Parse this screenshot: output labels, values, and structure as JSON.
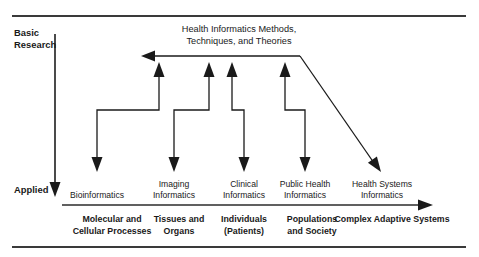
{
  "figure": {
    "title_line1": "Health Informatics Methods,",
    "title_line2": "Techniques, and Theories",
    "y_axis_top_label_line1": "Basic",
    "y_axis_top_label_line2": "Research",
    "y_axis_bottom_label": "Applied",
    "accent_color": "#1a1a1a",
    "rule_color": "#3a3a3a",
    "background_color": "#ffffff"
  },
  "columns": [
    {
      "id": "bioinformatics",
      "label_line1": "Bioinformatics",
      "label_line2": "",
      "domain_line1": "Molecular and",
      "domain_line2": "Cellular Processes",
      "x": 97,
      "domain_x": 112
    },
    {
      "id": "imaging-informatics",
      "label_line1": "Imaging",
      "label_line2": "Informatics",
      "domain_line1": "Tissues and",
      "domain_line2": "Organs",
      "x": 174,
      "domain_x": 179
    },
    {
      "id": "clinical-informatics",
      "label_line1": "Clinical",
      "label_line2": "Informatics",
      "domain_line1": "Individuals",
      "domain_line2": "(Patients)",
      "x": 244,
      "domain_x": 244
    },
    {
      "id": "public-health-informatics",
      "label_line1": "Public Health",
      "label_line2": "Informatics",
      "domain_line1": "Populations",
      "domain_line2": "and Society",
      "x": 305,
      "domain_x": 312
    },
    {
      "id": "health-systems-informatics",
      "label_line1": "Health Systems",
      "label_line2": "Informatics",
      "domain_line1": "Complex Adaptive Systems",
      "domain_line2": "",
      "x": 382,
      "domain_x": 392
    }
  ],
  "geometry": {
    "top_rule_y": 16,
    "bottom_rule_y": 247,
    "rule_left_x": 12,
    "rule_right_x": 466,
    "y_axis_x": 55,
    "y_axis_top_y": 34,
    "y_axis_bottom_y": 197,
    "x_axis_y": 205,
    "x_axis_left_x": 62,
    "x_axis_right_x": 433,
    "trunk_y": 56,
    "trunk_left_x": 142,
    "trunk_right_x": 300,
    "elbow_y": 110,
    "up_arrow_tip_y": 62,
    "down_arrow_tip_y": 172,
    "diagonal_end_x": 381,
    "diagonal_end_y": 172
  },
  "flows": [
    {
      "id": "flow-bioinformatics",
      "up_x": 159,
      "down_x": 97
    },
    {
      "id": "flow-imaging",
      "up_x": 209,
      "down_x": 174
    },
    {
      "id": "flow-clinical",
      "up_x": 232,
      "down_x": 244
    },
    {
      "id": "flow-public-health",
      "up_x": 285,
      "down_x": 305
    }
  ]
}
